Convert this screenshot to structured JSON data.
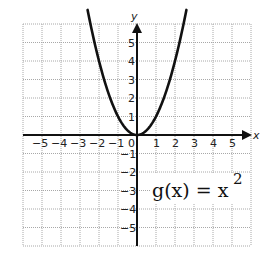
{
  "chart_data": {
    "type": "line",
    "function": "x^2",
    "xlabel": "x",
    "ylabel": "y",
    "xlim": [
      -6,
      6
    ],
    "ylim": [
      -6,
      6
    ],
    "grid": true,
    "x_ticks": [
      -5,
      -4,
      -3,
      -2,
      -1,
      0,
      1,
      2,
      3,
      4,
      5
    ],
    "y_ticks": [
      -5,
      -4,
      -3,
      -2,
      -1,
      1,
      2,
      3,
      4,
      5
    ],
    "series": [
      {
        "name": "g(x) = x^2",
        "x": [
          -2.5,
          -2,
          -1.5,
          -1,
          -0.5,
          0,
          0.5,
          1,
          1.5,
          2,
          2.5
        ],
        "y": [
          6.25,
          4,
          2.25,
          1,
          0.25,
          0,
          0.25,
          1,
          2.25,
          4,
          6.25
        ]
      }
    ]
  },
  "labels": {
    "x_axis": "x",
    "y_axis": "y",
    "formula_main": "g(x) = x",
    "formula_exponent": "2"
  },
  "style": {
    "curve_color": "#111111",
    "axis_color": "#111111",
    "grid_color": "#a8a8a8"
  }
}
